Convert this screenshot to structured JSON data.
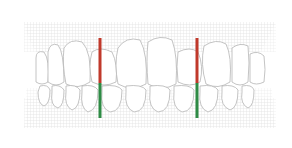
{
  "diagram": {
    "background_color": "#ffffff",
    "gum_grid_color": "#d9d9d9",
    "tooth_outline_color": "#b5b5b5",
    "markers": [
      {
        "name": "left-midline-marker",
        "x": 100,
        "upper_color": "#c0392b",
        "lower_color": "#2e8b45",
        "top": 38,
        "mid": 83,
        "bottom": 118
      },
      {
        "name": "right-midline-marker",
        "x": 197,
        "upper_color": "#c0392b",
        "lower_color": "#2e8b45",
        "top": 38,
        "mid": 83,
        "bottom": 118
      }
    ]
  }
}
